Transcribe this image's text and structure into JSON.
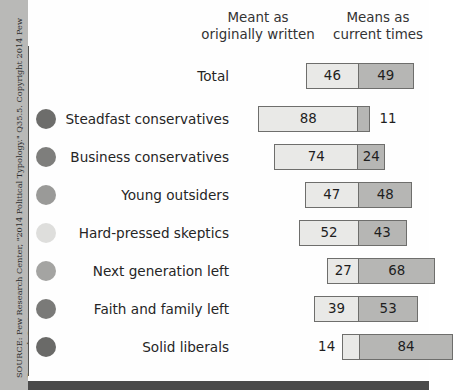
{
  "figure": {
    "source_credit": "SOURCE: Pew Research Center, \"2014 Political Typology.\" Q35.5. Copyright 2014 Pew Research Center.",
    "colors": {
      "left_segment": "#e9e9e7",
      "right_segment": "#b6b6b4",
      "bar_outline": "#6e6e6c",
      "gutter": "#b9b9b7",
      "panel": "#fefefe",
      "bottom_rule": "#4a4a4a",
      "divider_line": "#555553"
    }
  },
  "headers": {
    "left": "Meant as\noriginally written",
    "right": "Means as\ncurrent times"
  },
  "chart_data": {
    "type": "bar",
    "title": "",
    "subtitle": "",
    "xlabel": "",
    "ylabel": "",
    "orientation": "horizontal",
    "layout": "diverging-stacked",
    "grid": false,
    "legend_position": "top",
    "xlim": [
      0,
      100
    ],
    "series": [
      {
        "name": "Meant as originally written",
        "values": [
          46,
          88,
          74,
          47,
          52,
          27,
          39,
          14
        ]
      },
      {
        "name": "Means as current times",
        "values": [
          49,
          11,
          24,
          48,
          43,
          68,
          53,
          84
        ]
      }
    ],
    "categories": [
      "Total",
      "Steadfast conservatives",
      "Business conservatives",
      "Young outsiders",
      "Hard-pressed skeptics",
      "Next generation left",
      "Faith and family left",
      "Solid liberals"
    ]
  },
  "rows": [
    {
      "label": "Total",
      "dot": null,
      "left_value": "46",
      "right_value": "49",
      "left_outside": false,
      "right_outside": false
    },
    {
      "label": "Steadfast conservatives",
      "dot": "#6d6d6b",
      "left_value": "88",
      "right_value": "11",
      "left_outside": false,
      "right_outside": true
    },
    {
      "label": "Business conservatives",
      "dot": "#7e7e7c",
      "left_value": "74",
      "right_value": "24",
      "left_outside": false,
      "right_outside": false
    },
    {
      "label": "Young outsiders",
      "dot": "#9a9a98",
      "left_value": "47",
      "right_value": "48",
      "left_outside": false,
      "right_outside": false
    },
    {
      "label": "Hard-pressed skeptics",
      "dot": "#dedeDC",
      "left_value": "52",
      "right_value": "43",
      "left_outside": false,
      "right_outside": false
    },
    {
      "label": "Next generation left",
      "dot": "#a4a4a2",
      "left_value": "27",
      "right_value": "68",
      "left_outside": false,
      "right_outside": false
    },
    {
      "label": "Faith and family left",
      "dot": "#7a7a78",
      "left_value": "39",
      "right_value": "53",
      "left_outside": false,
      "right_outside": false
    },
    {
      "label": "Solid liberals",
      "dot": "#6a6a68",
      "left_value": "14",
      "right_value": "84",
      "left_outside": true,
      "right_outside": false
    }
  ]
}
